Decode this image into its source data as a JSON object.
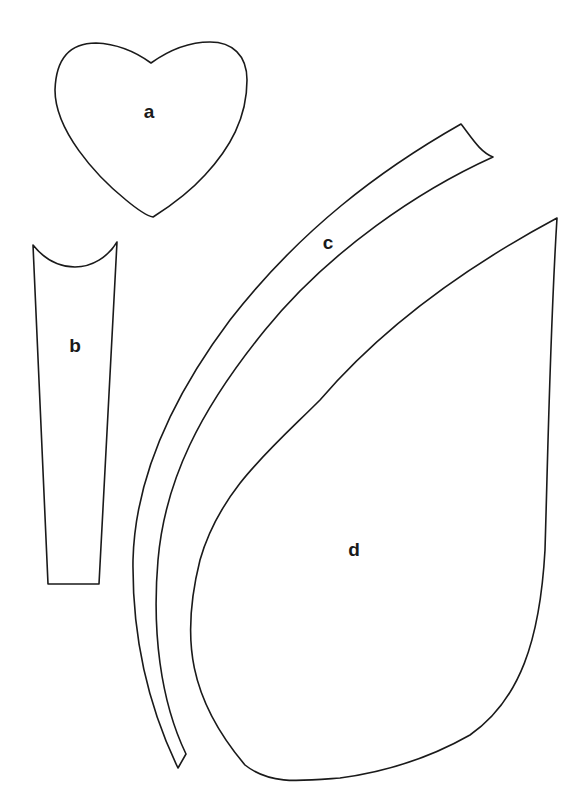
{
  "pieces": [
    {
      "id": "a",
      "label": "a",
      "shape": "heart"
    },
    {
      "id": "b",
      "label": "b",
      "shape": "tapered-strip-with-concave-top"
    },
    {
      "id": "c",
      "label": "c",
      "shape": "curved-stem"
    },
    {
      "id": "d",
      "label": "d",
      "shape": "leaf"
    }
  ],
  "colors": {
    "line": "#1a1a1a",
    "background": "#ffffff"
  }
}
